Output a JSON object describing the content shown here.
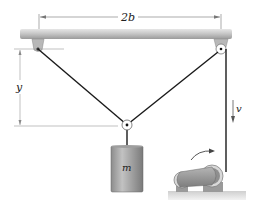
{
  "diagram": {
    "labels": {
      "span": "2b",
      "height": "y",
      "velocity": "v",
      "mass": "m"
    },
    "components": [
      "ceiling-beam",
      "left-fixed-pulley",
      "right-fixed-pulley",
      "movable-pulley",
      "hanging-mass",
      "winch-motor"
    ],
    "colors": {
      "cable": "#1a1a1a",
      "beam": "#c8c8c8",
      "mass": "#a9a9a9",
      "dimension": "#888888"
    }
  }
}
